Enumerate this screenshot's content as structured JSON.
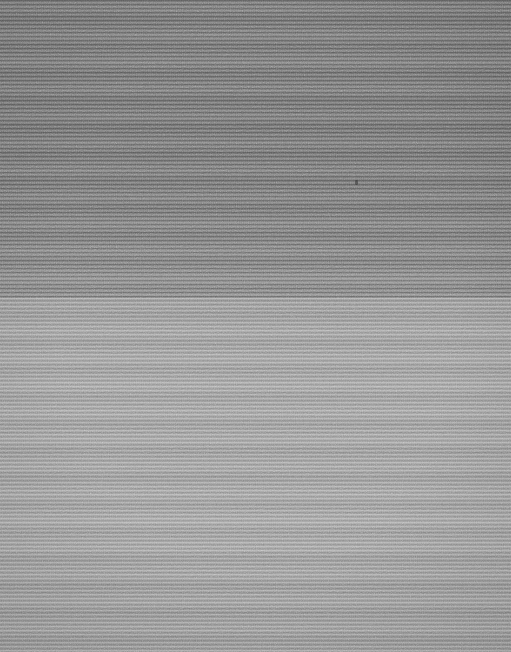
{
  "capture": {
    "width": 511,
    "height": 652,
    "state": "signal-lost",
    "legible_content": "none",
    "description": "Corrupted screen capture: horizontal scanline noise across the full frame with no text, icons, or UI structure recoverable."
  },
  "appearance": {
    "overall_background_hex": "#8a8a8a",
    "artifact_type": "horizontal-scanlines",
    "scanline_period_px": 4,
    "has_text": false,
    "has_icons": false,
    "has_borders": false,
    "has_panels": false
  },
  "zones": [
    {
      "name": "upper-dark-band",
      "top": 0,
      "height": 292,
      "mean_hex": "#787878",
      "scanline_contrast": "high",
      "scanline_spacing": "tight",
      "noise_density": "high"
    },
    {
      "name": "transition-band",
      "top": 286,
      "height": 30,
      "mean_hex": "#909090",
      "scanline_contrast": "medium",
      "scanline_spacing": "medium",
      "noise_density": "medium"
    },
    {
      "name": "lower-light-band",
      "top": 314,
      "height": 338,
      "mean_hex": "#9a9a9a",
      "scanline_contrast": "low",
      "scanline_spacing": "wide",
      "noise_density": "low"
    }
  ],
  "artifacts": [
    {
      "name": "dark-speck",
      "x": 355,
      "y": 180,
      "width": 3,
      "height": 5,
      "note": "isolated sensor/compression speck, not a cursor or glyph"
    }
  ]
}
